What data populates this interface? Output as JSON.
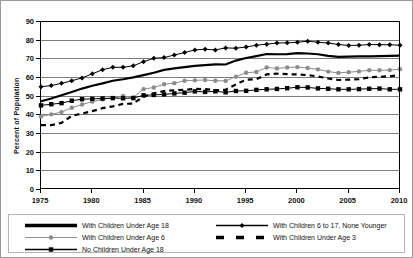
{
  "chart_data": {
    "type": "line",
    "title": "",
    "xlabel": "",
    "ylabel": "Percent of Population",
    "xlim": [
      1975,
      2010
    ],
    "ylim": [
      0,
      90
    ],
    "yticks": [
      0,
      10,
      20,
      30,
      40,
      50,
      60,
      70,
      80,
      90
    ],
    "xticks": [
      1975,
      1980,
      1985,
      1990,
      1995,
      2000,
      2005,
      2010
    ],
    "grid": "horizontal",
    "legend_position": "bottom",
    "x": [
      1975,
      1976,
      1977,
      1978,
      1979,
      1980,
      1981,
      1982,
      1983,
      1984,
      1985,
      1986,
      1987,
      1988,
      1989,
      1990,
      1991,
      1992,
      1993,
      1994,
      1995,
      1996,
      1997,
      1998,
      1999,
      2000,
      2001,
      2002,
      2003,
      2004,
      2005,
      2006,
      2007,
      2008,
      2009,
      2010
    ],
    "series": [
      {
        "name": "With Children Under Age 18",
        "marker": "none",
        "style": "solid-thick",
        "color": "#000000",
        "values": [
          47.0,
          48.5,
          50.2,
          52.0,
          53.8,
          55.3,
          56.6,
          58.0,
          58.8,
          59.8,
          61.0,
          62.3,
          63.8,
          64.6,
          65.3,
          66.0,
          66.4,
          66.8,
          66.7,
          68.8,
          70.2,
          71.2,
          72.3,
          72.2,
          72.3,
          72.8,
          72.6,
          72.2,
          71.3,
          70.8,
          70.9,
          71.1,
          71.1,
          71.2,
          71.3,
          71.4
        ]
      },
      {
        "name": "With Children 6 to 17, None Younger",
        "marker": "diamond",
        "style": "solid-thin",
        "color": "#000000",
        "values": [
          54.8,
          55.4,
          56.6,
          58.0,
          59.5,
          61.7,
          63.9,
          65.2,
          65.2,
          66.0,
          68.2,
          70.0,
          70.4,
          71.8,
          73.1,
          74.5,
          74.9,
          74.5,
          75.6,
          75.4,
          76.1,
          77.0,
          77.6,
          78.2,
          78.3,
          78.6,
          79.2,
          78.6,
          78.2,
          77.4,
          76.9,
          77.0,
          77.4,
          77.3,
          77.3,
          77.0
        ]
      },
      {
        "name": "With Children Under Age 6",
        "marker": "circle",
        "style": "solid-thin",
        "color": "#8c8c8c",
        "values": [
          38.9,
          40.0,
          41.2,
          43.5,
          45.3,
          46.8,
          48.0,
          48.7,
          49.9,
          49.0,
          53.5,
          54.4,
          56.1,
          56.7,
          58.0,
          58.2,
          58.4,
          58.0,
          57.9,
          60.2,
          62.3,
          62.7,
          65.1,
          64.6,
          65.1,
          65.3,
          64.8,
          64.1,
          62.9,
          62.2,
          62.6,
          63.0,
          63.6,
          63.6,
          63.7,
          64.2
        ]
      },
      {
        "name": "With Children Under Age 3",
        "marker": "none",
        "style": "dashed",
        "color": "#000000",
        "values": [
          34.2,
          34.2,
          35.4,
          39.2,
          40.4,
          41.7,
          43.3,
          44.3,
          45.6,
          45.8,
          49.5,
          51.2,
          52.5,
          52.9,
          53.1,
          53.6,
          53.5,
          52.9,
          53.2,
          56.0,
          58.6,
          58.8,
          61.4,
          61.8,
          61.5,
          61.4,
          61.0,
          60.3,
          59.2,
          58.4,
          58.6,
          58.9,
          59.8,
          60.1,
          60.4,
          61.0
        ]
      },
      {
        "name": "No Children Under Age 18",
        "marker": "square",
        "style": "solid-thin",
        "color": "#000000",
        "values": [
          44.8,
          45.4,
          46.0,
          47.3,
          48.1,
          48.3,
          48.5,
          48.7,
          48.6,
          48.7,
          50.2,
          50.4,
          50.7,
          51.2,
          51.6,
          52.3,
          52.0,
          52.3,
          51.8,
          52.5,
          52.6,
          53.1,
          53.4,
          53.6,
          54.0,
          54.5,
          54.4,
          53.9,
          53.7,
          53.4,
          53.4,
          53.5,
          53.7,
          53.8,
          53.4,
          53.4
        ]
      }
    ]
  },
  "legend": {
    "columns": [
      [
        {
          "label": "With Children Under Age 18",
          "mark": "solid-thick"
        },
        {
          "label": "With Children Under Age 6",
          "mark": "gray-circle"
        },
        {
          "label": "No Children Under Age 18",
          "mark": "black-square"
        }
      ],
      [
        {
          "label": "With Children 6 to 17, None Younger",
          "mark": "black-diamond"
        },
        {
          "label": "With Children Under Age 3",
          "mark": "dashed"
        }
      ]
    ]
  }
}
